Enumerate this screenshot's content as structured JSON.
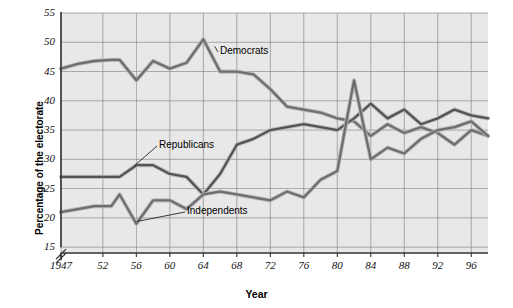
{
  "figure": {
    "kind": "line-chart",
    "background": "#ffffff",
    "plot_background": "#e8e8e8",
    "grid_color": "#7a7a7a",
    "axis_color": "#333333",
    "axis_break_glyph": "axis-break"
  },
  "chart_data": {
    "type": "line",
    "title": "",
    "xlabel": "Year",
    "ylabel": "Percentage of the electorate",
    "xlim": [
      1947,
      1998
    ],
    "ylim": [
      14,
      55
    ],
    "grid": true,
    "legend": "inline-annotations",
    "y_axis_break": true,
    "y_ticks": [
      15,
      20,
      25,
      30,
      35,
      40,
      45,
      50,
      55
    ],
    "x_ticks": [
      1947,
      1952,
      1956,
      1960,
      1964,
      1968,
      1972,
      1976,
      1980,
      1984,
      1988,
      1992,
      1996
    ],
    "x_tick_labels": [
      "1947",
      "52",
      "56",
      "60",
      "64",
      "68",
      "72",
      "76",
      "80",
      "84",
      "88",
      "92",
      "96"
    ],
    "x": [
      1947,
      1949,
      1951,
      1953,
      1954,
      1956,
      1958,
      1960,
      1962,
      1964,
      1966,
      1968,
      1970,
      1972,
      1974,
      1976,
      1978,
      1980,
      1982,
      1984,
      1986,
      1988,
      1990,
      1992,
      1994,
      1996,
      1998
    ],
    "series": [
      {
        "name": "Democrats",
        "color": "#6e6e6e",
        "values": [
          45.5,
          46.3,
          46.8,
          47.0,
          47.0,
          43.5,
          46.8,
          45.5,
          46.5,
          50.5,
          45.0,
          45.0,
          44.5,
          42.0,
          39.0,
          38.5,
          38.0,
          37.0,
          36.5,
          34.0,
          36.0,
          34.5,
          35.5,
          34.5,
          32.5,
          35.0,
          34.0
        ]
      },
      {
        "name": "Republicans",
        "color": "#545454",
        "values": [
          27.0,
          27.0,
          27.0,
          27.0,
          27.0,
          29.0,
          29.0,
          27.5,
          27.0,
          24.0,
          27.5,
          32.5,
          33.5,
          35.0,
          35.5,
          36.0,
          35.5,
          35.0,
          37.0,
          39.5,
          37.0,
          38.5,
          36.0,
          37.0,
          38.5,
          37.5,
          37.0
        ]
      },
      {
        "name": "Independents",
        "color": "#6e6e6e",
        "values": [
          21.0,
          21.5,
          22.0,
          22.0,
          24.0,
          19.0,
          23.0,
          23.0,
          21.5,
          24.0,
          24.5,
          24.0,
          23.5,
          23.0,
          24.5,
          23.5,
          26.5,
          28.0,
          43.5,
          30.0,
          32.0,
          31.0,
          33.5,
          35.0,
          35.5,
          36.5,
          34.0
        ]
      }
    ],
    "annotations": [
      {
        "text": "Democrats",
        "target_x": 1965,
        "target_y": 49.0
      },
      {
        "text": "Republicans",
        "target_x": 1956,
        "target_y": 29.0
      },
      {
        "text": "Independents",
        "target_x": 1956,
        "target_y": 19.2
      }
    ]
  },
  "axis": {
    "y_title": "Percentage of the electorate",
    "x_title": "Year",
    "y_tick_labels": [
      "55",
      "50",
      "45",
      "40",
      "35",
      "30",
      "25",
      "20",
      "15"
    ],
    "x_tick_labels": [
      "1947",
      "52",
      "56",
      "60",
      "64",
      "68",
      "72",
      "76",
      "80",
      "84",
      "88",
      "92",
      "96"
    ]
  },
  "labels": {
    "democrats": "Democrats",
    "republicans": "Republicans",
    "independents": "Independents"
  }
}
